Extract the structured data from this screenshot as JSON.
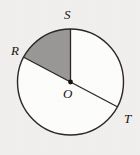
{
  "figure": {
    "type": "circle-sector-diagram",
    "background_color": "#f1f0ee",
    "circle": {
      "center_label": "O",
      "center_x": 70.5,
      "center_y": 82,
      "radius": 53,
      "stroke_color": "#2a2724",
      "stroke_width": 1.4,
      "fill_color": "#fdfdfc"
    },
    "center_dot": {
      "name": "O",
      "x": 70.5,
      "y": 82,
      "radius": 2.4,
      "color": "#15120f"
    },
    "shaded_sector": {
      "from_point": "S",
      "to_point": "R",
      "fill_color": "#999897",
      "start_angle_deg": 90,
      "end_angle_deg": 152,
      "stroke_color": "#2a2724"
    },
    "points": [
      {
        "label": "S",
        "x": 70.5,
        "y": 29,
        "angle_deg": 90,
        "label_x": 64,
        "label_y": 8
      },
      {
        "label": "R",
        "x": 23.7,
        "y": 57.2,
        "angle_deg": 152,
        "label_x": 11,
        "label_y": 44
      },
      {
        "label": "T",
        "x": 117.3,
        "y": 106.8,
        "angle_deg": -28,
        "label_x": 124,
        "label_y": 112
      }
    ],
    "segments": [
      {
        "name": "radius-OS",
        "from": "O",
        "to": "S"
      },
      {
        "name": "diameter-RT",
        "from": "R",
        "to": "T"
      }
    ],
    "labels": {
      "S": "S",
      "R": "R",
      "O": "O",
      "T": "T"
    }
  }
}
